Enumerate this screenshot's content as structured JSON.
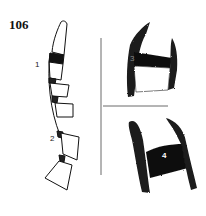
{
  "figure": {
    "number": "106",
    "labels": {
      "segment_1": "1",
      "segment_2": "2",
      "panel_3": "3",
      "panel_4": "4"
    },
    "colors": {
      "ink": "#111111",
      "background": "#ffffff",
      "label_on_dark": "#ffffff"
    }
  }
}
